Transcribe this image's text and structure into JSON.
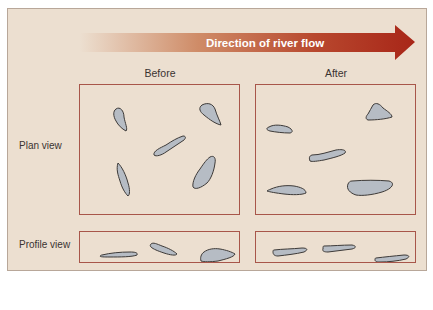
{
  "diagram": {
    "arrow": {
      "label": "Direction of river flow",
      "gradient_start": "#ecdfd0",
      "gradient_mid": "#c87a55",
      "gradient_end": "#a8281a"
    },
    "columns": [
      {
        "title": "Before"
      },
      {
        "title": "After"
      }
    ],
    "rows": [
      {
        "label": "Plan view"
      },
      {
        "label": "Profile view"
      }
    ],
    "colors": {
      "panel_background": "#ecdfd0",
      "box_border": "#a8564a",
      "clast_fill": "#b6bcc4",
      "clast_stroke": "#3d3a38"
    }
  }
}
